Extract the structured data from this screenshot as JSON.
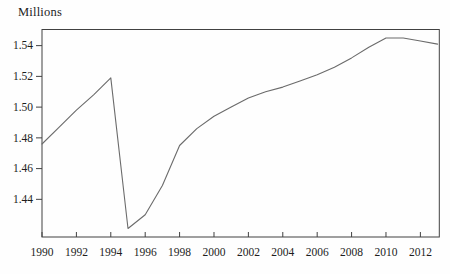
{
  "figure": {
    "background": "#fefefe"
  },
  "chart_data": {
    "type": "line",
    "title": "",
    "ylabel": "Millions",
    "xlabel": "",
    "x": [
      1990,
      1991,
      1992,
      1993,
      1994,
      1995,
      1996,
      1997,
      1998,
      1999,
      2000,
      2001,
      2002,
      2003,
      2004,
      2005,
      2006,
      2007,
      2008,
      2009,
      2010,
      2011,
      2012,
      2013
    ],
    "values": [
      1.476,
      1.487,
      1.498,
      1.508,
      1.519,
      1.421,
      1.43,
      1.449,
      1.475,
      1.486,
      1.494,
      1.5,
      1.506,
      1.51,
      1.513,
      1.517,
      1.521,
      1.526,
      1.532,
      1.539,
      1.545,
      1.545,
      1.543,
      1.541
    ],
    "xticks": [
      1990,
      1992,
      1994,
      1996,
      1998,
      2000,
      2002,
      2004,
      2006,
      2008,
      2010,
      2012
    ],
    "yticks": [
      1.44,
      1.46,
      1.48,
      1.5,
      1.52,
      1.54
    ],
    "ylim": [
      1.4155,
      1.5505
    ],
    "xlim": [
      1990,
      2013.1
    ],
    "grid": false,
    "legend": "none",
    "line_color": "#6b6b6b",
    "axis_color": "#414141",
    "tick_label_color": "#1d1d1d"
  }
}
